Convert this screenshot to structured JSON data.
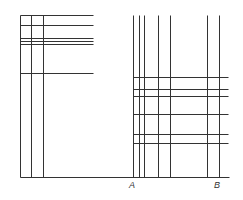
{
  "diagram": {
    "line_color": "#333333",
    "left_block": {
      "verticals_x": [
        20,
        31,
        43
      ],
      "vertical_top": 15,
      "horizontals_y": [
        15,
        25,
        38,
        41,
        44,
        73
      ],
      "horizontal_x2": 93
    },
    "right_block": {
      "verticals_x": [
        133,
        139,
        144,
        158,
        170,
        207,
        219
      ],
      "vertical_top": 15,
      "horizontals_y": [
        77,
        89,
        96,
        114,
        134,
        143
      ],
      "horizontal_x1": 133,
      "horizontal_x2": 228
    },
    "baseline": {
      "y": 177,
      "x1": 20,
      "x2": 229
    },
    "labels": [
      {
        "text": "A",
        "x": 129,
        "y": 180
      },
      {
        "text": "B",
        "x": 214,
        "y": 180
      }
    ]
  }
}
